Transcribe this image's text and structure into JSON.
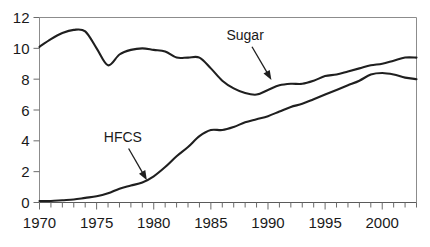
{
  "chart_data": {
    "type": "line",
    "title": "",
    "xlabel": "",
    "ylabel": "",
    "xlim": [
      1970,
      2003
    ],
    "ylim": [
      0,
      12
    ],
    "grid": false,
    "legend_position": "none",
    "y_ticks": [
      0,
      2,
      4,
      6,
      8,
      10,
      12
    ],
    "y_tick_labels": [
      "0",
      "2",
      "4",
      "6",
      "8",
      "10",
      "12"
    ],
    "x_ticks": [
      1970,
      1975,
      1980,
      1985,
      1990,
      1995,
      2000
    ],
    "x_tick_labels": [
      "1970",
      "1975",
      "1980",
      "1985",
      "1990",
      "1995",
      "2000"
    ],
    "x_minor_tick_interval": 1,
    "x": [
      1970,
      1971,
      1972,
      1973,
      1974,
      1975,
      1976,
      1977,
      1978,
      1979,
      1980,
      1981,
      1982,
      1983,
      1984,
      1985,
      1986,
      1987,
      1988,
      1989,
      1990,
      1991,
      1992,
      1993,
      1994,
      1995,
      1996,
      1997,
      1998,
      1999,
      2000,
      2001,
      2002,
      2003
    ],
    "series": [
      {
        "name": "Sugar",
        "color": "#1f1f1f",
        "values": [
          10.1,
          10.6,
          11.0,
          11.2,
          11.1,
          10.0,
          8.9,
          9.6,
          9.9,
          10.0,
          9.9,
          9.8,
          9.4,
          9.4,
          9.4,
          8.7,
          7.9,
          7.4,
          7.1,
          7.0,
          7.3,
          7.6,
          7.7,
          7.7,
          7.9,
          8.2,
          8.3,
          8.5,
          8.7,
          8.9,
          9.0,
          9.2,
          9.4,
          9.4
        ]
      },
      {
        "name": "HFCS",
        "color": "#1f1f1f",
        "values": [
          0.1,
          0.1,
          0.15,
          0.2,
          0.3,
          0.4,
          0.6,
          0.9,
          1.1,
          1.3,
          1.7,
          2.3,
          3.0,
          3.6,
          4.3,
          4.7,
          4.7,
          4.9,
          5.2,
          5.4,
          5.6,
          5.9,
          6.2,
          6.4,
          6.7,
          7.0,
          7.3,
          7.6,
          7.9,
          8.3,
          8.4,
          8.3,
          8.1,
          8.0
        ]
      }
    ],
    "annotations": [
      {
        "label": "Sugar",
        "text_x": 1988.0,
        "text_y": 10.55,
        "arrow_from_x": 1988.6,
        "arrow_from_y": 10.1,
        "arrow_to_x": 1990.3,
        "arrow_to_y": 7.95
      },
      {
        "label": "HFCS",
        "text_x": 1977.3,
        "text_y": 3.95,
        "arrow_from_x": 1977.8,
        "arrow_from_y": 3.5,
        "arrow_to_x": 1979.4,
        "arrow_to_y": 1.45
      }
    ]
  }
}
